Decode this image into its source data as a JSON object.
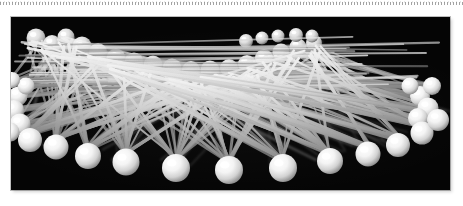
{
  "page": {
    "background_color": "#ffffff",
    "width": 463,
    "height": 206
  },
  "ruler_strip": {
    "name": "dotted-ruler-strip",
    "description": "faint grey dotted perforation line across the top edge",
    "color": "#6e6e6e",
    "dash_period_px": 3
  },
  "photo": {
    "caption": "Close-up photograph of many white ball-head pins crossing over a black background",
    "subject": "white ball-head sewing pins",
    "background_color": "#050505",
    "pin_head_color": "#ffffff",
    "pin_shaft_color": "#d8d8d8",
    "frame": {
      "left": 11,
      "top": 17,
      "width": 439,
      "height": 173
    },
    "counts": {
      "front_row_heads": 12,
      "back_row_heads": 17,
      "left_cluster_heads": 6,
      "right_cluster_heads": 5,
      "shafts": 180
    }
  },
  "scene": {
    "back_row": [
      {
        "x": 36,
        "y": 38,
        "r": 9.5
      },
      {
        "x": 52,
        "y": 44,
        "r": 9.0
      },
      {
        "x": 66,
        "y": 37,
        "r": 8.5
      },
      {
        "x": 82,
        "y": 46,
        "r": 9.5
      },
      {
        "x": 98,
        "y": 52,
        "r": 9.0
      },
      {
        "x": 116,
        "y": 58,
        "r": 9.5
      },
      {
        "x": 134,
        "y": 62,
        "r": 9.5
      },
      {
        "x": 153,
        "y": 65,
        "r": 9.5
      },
      {
        "x": 172,
        "y": 68,
        "r": 9.5
      },
      {
        "x": 191,
        "y": 70,
        "r": 9.0
      },
      {
        "x": 210,
        "y": 70,
        "r": 9.5
      },
      {
        "x": 229,
        "y": 68,
        "r": 9.0
      },
      {
        "x": 247,
        "y": 64,
        "r": 9.0
      },
      {
        "x": 264,
        "y": 58,
        "r": 9.0
      },
      {
        "x": 281,
        "y": 52,
        "r": 8.5
      },
      {
        "x": 298,
        "y": 47,
        "r": 8.5
      },
      {
        "x": 314,
        "y": 43,
        "r": 8.0
      }
    ],
    "upper_ridge": [
      {
        "x": 246,
        "y": 41,
        "r": 7.0
      },
      {
        "x": 262,
        "y": 38,
        "r": 6.5
      },
      {
        "x": 278,
        "y": 36,
        "r": 6.5
      },
      {
        "x": 296,
        "y": 35,
        "r": 7.0
      },
      {
        "x": 312,
        "y": 36,
        "r": 6.5
      }
    ],
    "front_row": [
      {
        "x": 30,
        "y": 140,
        "r": 12
      },
      {
        "x": 56,
        "y": 147,
        "r": 12.5
      },
      {
        "x": 88,
        "y": 156,
        "r": 13
      },
      {
        "x": 126,
        "y": 162,
        "r": 13.5
      },
      {
        "x": 176,
        "y": 168,
        "r": 14
      },
      {
        "x": 229,
        "y": 170,
        "r": 14
      },
      {
        "x": 283,
        "y": 168,
        "r": 14
      },
      {
        "x": 330,
        "y": 161,
        "r": 13
      },
      {
        "x": 368,
        "y": 154,
        "r": 12.5
      },
      {
        "x": 398,
        "y": 145,
        "r": 12
      },
      {
        "x": 422,
        "y": 133,
        "r": 11.5
      },
      {
        "x": 438,
        "y": 120,
        "r": 11
      }
    ],
    "left_cluster": [
      {
        "x": 18,
        "y": 96,
        "r": 9.5
      },
      {
        "x": 14,
        "y": 110,
        "r": 10
      },
      {
        "x": 20,
        "y": 124,
        "r": 10.5
      },
      {
        "x": 10,
        "y": 132,
        "r": 9.5
      },
      {
        "x": 26,
        "y": 86,
        "r": 8.5
      },
      {
        "x": 12,
        "y": 80,
        "r": 8.0
      }
    ],
    "right_cluster": [
      {
        "x": 420,
        "y": 96,
        "r": 10
      },
      {
        "x": 428,
        "y": 108,
        "r": 10.5
      },
      {
        "x": 418,
        "y": 118,
        "r": 10
      },
      {
        "x": 432,
        "y": 86,
        "r": 9.0
      },
      {
        "x": 410,
        "y": 86,
        "r": 8.5
      }
    ]
  }
}
